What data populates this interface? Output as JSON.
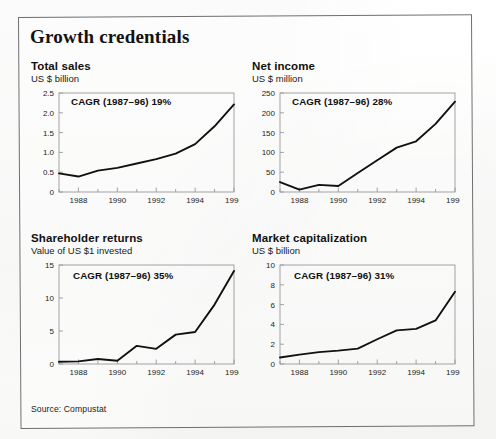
{
  "figure": {
    "title": "Growth credentials",
    "source_note": "Source: Compustat",
    "frame_color": "#6f6f6f",
    "line_color": "#111111",
    "axis_color": "#9a9a9a"
  },
  "panels": [
    {
      "id": "total-sales",
      "title": "Total sales",
      "subtitle": "US $ billion",
      "cagr_label": "CAGR (1987–96) 19%"
    },
    {
      "id": "net-income",
      "title": "Net income",
      "subtitle": "US $ million",
      "cagr_label": "CAGR (1987–96) 28%"
    },
    {
      "id": "shareholder-returns",
      "title": "Shareholder returns",
      "subtitle": "Value of US $1 invested",
      "cagr_label": "CAGR (1987–96) 35%"
    },
    {
      "id": "market-capitalization",
      "title": "Market capitalization",
      "subtitle": "US $ billion",
      "cagr_label": "CAGR (1987–96) 31%"
    }
  ],
  "chart_data": [
    {
      "type": "line",
      "title": "Total sales",
      "subtitle": "US $ billion",
      "xlabel": "",
      "ylabel": "US $ billion",
      "annotation": "CAGR (1987–96) 19%",
      "x": [
        1987,
        1988,
        1989,
        1990,
        1991,
        1992,
        1993,
        1994,
        1995,
        1996
      ],
      "values": [
        0.47,
        0.39,
        0.54,
        0.61,
        0.72,
        0.83,
        0.97,
        1.21,
        1.66,
        2.21
      ],
      "xlim": [
        1987,
        1996
      ],
      "ylim": [
        0,
        2.5
      ],
      "yticks": [
        0,
        0.5,
        1.0,
        1.5,
        2.0,
        2.5
      ],
      "ytick_labels": [
        "0",
        "0.5",
        "1.0",
        "1.5",
        "2.0",
        "2.5"
      ],
      "xticks": [
        1988,
        1990,
        1992,
        1994,
        1996
      ],
      "xtick_labels": [
        "1988",
        "1990",
        "1992",
        "1994",
        "1996"
      ],
      "grid": false,
      "legend": "none"
    },
    {
      "type": "line",
      "title": "Net income",
      "subtitle": "US $ million",
      "xlabel": "",
      "ylabel": "US $ million",
      "annotation": "CAGR (1987–96) 28%",
      "x": [
        1987,
        1988,
        1989,
        1990,
        1991,
        1992,
        1993,
        1994,
        1995,
        1996
      ],
      "values": [
        25,
        6,
        18,
        15,
        48,
        80,
        112,
        128,
        172,
        228
      ],
      "xlim": [
        1987,
        1996
      ],
      "ylim": [
        0,
        250
      ],
      "yticks": [
        0,
        50,
        100,
        150,
        200,
        250
      ],
      "ytick_labels": [
        "0",
        "50",
        "100",
        "150",
        "200",
        "250"
      ],
      "xticks": [
        1988,
        1990,
        1992,
        1994,
        1996
      ],
      "xtick_labels": [
        "1988",
        "1990",
        "1992",
        "1994",
        "1996"
      ],
      "grid": false,
      "legend": "none"
    },
    {
      "type": "line",
      "title": "Shareholder returns",
      "subtitle": "Value of US $1 invested",
      "xlabel": "",
      "ylabel": "Value of US $1 invested",
      "annotation": "CAGR (1987–96) 35%",
      "x": [
        1987,
        1988,
        1989,
        1990,
        1991,
        1992,
        1993,
        1994,
        1995,
        1996
      ],
      "values": [
        0.35,
        0.4,
        0.75,
        0.5,
        2.75,
        2.3,
        4.45,
        4.85,
        9.0,
        14.1
      ],
      "xlim": [
        1987,
        1996
      ],
      "ylim": [
        0,
        15
      ],
      "yticks": [
        0,
        5,
        10,
        15
      ],
      "ytick_labels": [
        "0",
        "5",
        "10",
        "15"
      ],
      "xticks": [
        1988,
        1990,
        1992,
        1994,
        1996
      ],
      "xtick_labels": [
        "1988",
        "1990",
        "1992",
        "1994",
        "1996"
      ],
      "grid": false,
      "legend": "none"
    },
    {
      "type": "line",
      "title": "Market capitalization",
      "subtitle": "US $ billion",
      "xlabel": "",
      "ylabel": "US $ billion",
      "annotation": "CAGR (1987–96) 31%",
      "x": [
        1987,
        1988,
        1989,
        1990,
        1991,
        1992,
        1993,
        1994,
        1995,
        1996
      ],
      "values": [
        0.65,
        0.95,
        1.2,
        1.35,
        1.55,
        2.5,
        3.4,
        3.55,
        4.4,
        7.3
      ],
      "xlim": [
        1987,
        1996
      ],
      "ylim": [
        0,
        10
      ],
      "yticks": [
        0,
        2,
        4,
        6,
        8,
        10
      ],
      "ytick_labels": [
        "0",
        "2",
        "4",
        "6",
        "8",
        "10"
      ],
      "xticks": [
        1988,
        1990,
        1992,
        1994,
        1996
      ],
      "xtick_labels": [
        "1988",
        "1990",
        "1992",
        "1994",
        "1996"
      ],
      "grid": false,
      "legend": "none"
    }
  ]
}
